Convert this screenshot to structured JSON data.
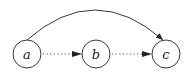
{
  "diagram": {
    "type": "directed-graph",
    "nodes": [
      {
        "id": "a",
        "label": "a",
        "cx": 27,
        "cy": 54,
        "r": 14
      },
      {
        "id": "b",
        "label": "b",
        "cx": 96,
        "cy": 54,
        "r": 14
      },
      {
        "id": "c",
        "label": "c",
        "cx": 166,
        "cy": 54,
        "r": 14
      }
    ],
    "edges": [
      {
        "from": "a",
        "to": "b",
        "style": "dotted"
      },
      {
        "from": "b",
        "to": "c",
        "style": "dotted"
      },
      {
        "from": "a",
        "to": "c",
        "style": "solid",
        "shape": "arc"
      }
    ],
    "colors": {
      "stroke": "#3a3a3a",
      "background": "#ffffff"
    }
  }
}
